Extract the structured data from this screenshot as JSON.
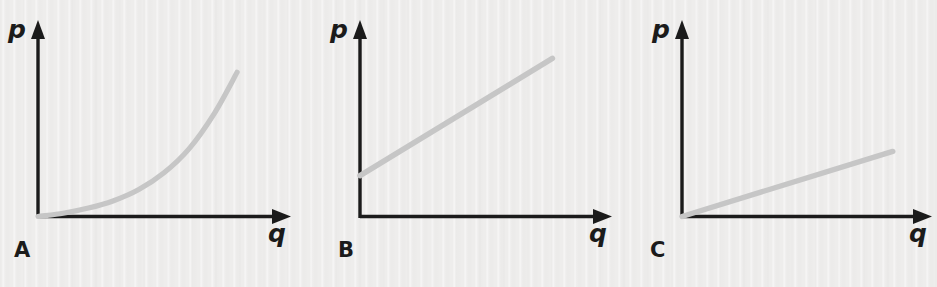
{
  "figure": {
    "width": 937,
    "height": 287,
    "background_color": "#eeedec",
    "ink_color": "#1b1b1b",
    "curve_color": "#c6c6c6",
    "clipped_caption_above": "",
    "axis_label_x": "q",
    "axis_label_y": "p"
  },
  "chart_data": [
    {
      "type": "line",
      "panel": "A",
      "title": "",
      "xlabel": "q",
      "ylabel": "p",
      "grid": false,
      "legend": null,
      "xlim": [
        0,
        10
      ],
      "ylim": [
        0,
        10
      ],
      "curve_shape": "convex-increasing-exponential",
      "starts_at_origin": true,
      "series": [
        {
          "name": "A",
          "color": "#c6c6c6",
          "x": [
            0.0,
            1.0,
            2.0,
            3.0,
            4.0,
            5.0,
            6.0,
            7.0,
            7.9
          ],
          "values": [
            0.0,
            0.18,
            0.45,
            0.85,
            1.45,
            2.35,
            3.65,
            5.55,
            7.75
          ]
        }
      ]
    },
    {
      "type": "line",
      "panel": "B",
      "title": "",
      "xlabel": "q",
      "ylabel": "p",
      "grid": false,
      "legend": null,
      "xlim": [
        0,
        10
      ],
      "ylim": [
        0,
        10
      ],
      "curve_shape": "straight-increasing-positive-intercept",
      "starts_at_origin": false,
      "series": [
        {
          "name": "B",
          "color": "#c6c6c6",
          "x": [
            0.0,
            7.4
          ],
          "values": [
            2.2,
            8.5
          ]
        }
      ]
    },
    {
      "type": "line",
      "panel": "C",
      "title": "",
      "xlabel": "q",
      "ylabel": "p",
      "grid": false,
      "legend": null,
      "xlim": [
        0,
        10
      ],
      "ylim": [
        0,
        10
      ],
      "curve_shape": "straight-increasing-through-origin-shallow",
      "starts_at_origin": true,
      "series": [
        {
          "name": "C",
          "color": "#c6c6c6",
          "x": [
            0.0,
            8.3
          ],
          "values": [
            0.0,
            3.5
          ]
        }
      ]
    }
  ],
  "panels": [
    {
      "letter": "A",
      "x_axis_label": "q",
      "y_axis_label": "p"
    },
    {
      "letter": "B",
      "x_axis_label": "q",
      "y_axis_label": "p"
    },
    {
      "letter": "C",
      "x_axis_label": "q",
      "y_axis_label": "p"
    }
  ]
}
